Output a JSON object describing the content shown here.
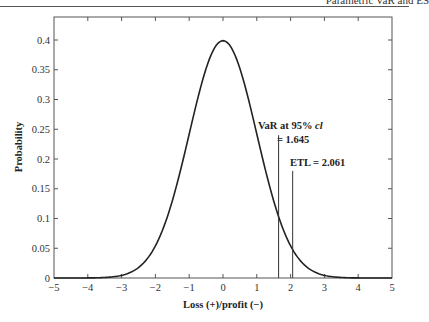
{
  "page": {
    "running_header": "Parametric VaR and ES"
  },
  "chart_data": {
    "type": "line",
    "title": "",
    "xlabel": "Loss (+)/profit (−)",
    "ylabel": "Probability",
    "xlim": [
      -5,
      5
    ],
    "ylim": [
      0,
      0.42
    ],
    "grid": false,
    "legend": null,
    "x_ticks": [
      "−5",
      "−4",
      "−3",
      "−2",
      "−1",
      "0",
      "1",
      "2",
      "3",
      "4",
      "5"
    ],
    "y_ticks": [
      "0",
      "0.05",
      "0.1",
      "0.15",
      "0.2",
      "0.25",
      "0.3",
      "0.35",
      "0.4"
    ],
    "series": [
      {
        "name": "Standard normal density",
        "x": [
          -5,
          -4.5,
          -4,
          -3.5,
          -3,
          -2.5,
          -2,
          -1.75,
          -1.5,
          -1.25,
          -1,
          -0.75,
          -0.5,
          -0.25,
          0,
          0.25,
          0.5,
          0.75,
          1,
          1.25,
          1.5,
          1.75,
          2,
          2.5,
          3,
          3.5,
          4,
          4.5,
          5
        ],
        "y": [
          0.0,
          0.0,
          0.0001,
          0.0009,
          0.0044,
          0.0175,
          0.054,
          0.0863,
          0.1295,
          0.1826,
          0.242,
          0.3011,
          0.3521,
          0.3867,
          0.3989,
          0.3867,
          0.3521,
          0.3011,
          0.242,
          0.1826,
          0.1295,
          0.0863,
          0.054,
          0.0175,
          0.0044,
          0.0009,
          0.0001,
          0.0,
          0.0
        ]
      }
    ],
    "annotations": [
      {
        "label_line1": "VaR at 95% ",
        "label_italic": "cl",
        "label_line2": "= 1.645",
        "x": 1.645,
        "line_top_y": 0.24
      },
      {
        "label_line1": "ETL = 2.061",
        "x": 2.061,
        "line_top_y": 0.18
      }
    ]
  }
}
